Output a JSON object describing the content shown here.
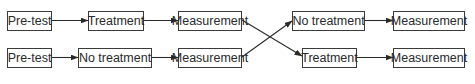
{
  "diagram": {
    "rows": [
      {
        "steps": [
          {
            "label": "Pre-test"
          },
          {
            "label": "Treatment"
          },
          {
            "label": "Measurement"
          },
          {
            "label": "No treatment"
          },
          {
            "label": "Measurement"
          }
        ]
      },
      {
        "steps": [
          {
            "label": "Pre-test"
          },
          {
            "label": "No treatment"
          },
          {
            "label": "Measurement"
          },
          {
            "label": "Treatment"
          },
          {
            "label": "Measurement"
          }
        ]
      }
    ],
    "connections": [
      {
        "from": "row1-pretest",
        "to": "row1-treatment"
      },
      {
        "from": "row1-treatment",
        "to": "row1-measurement-1"
      },
      {
        "from": "row1-measurement-1",
        "to": "row2-treatment",
        "type": "crossover"
      },
      {
        "from": "row2-measurement-1",
        "to": "row1-no-treatment",
        "type": "crossover"
      },
      {
        "from": "row1-no-treatment",
        "to": "row1-measurement-2"
      },
      {
        "from": "row2-pretest",
        "to": "row2-no-treatment"
      },
      {
        "from": "row2-no-treatment",
        "to": "row2-measurement-1"
      },
      {
        "from": "row2-treatment",
        "to": "row2-measurement-2"
      }
    ],
    "colors": {
      "line": "#2a2a2a",
      "border": "#3a3a3a",
      "text": "#2a2a2a",
      "background": "#ffffff"
    }
  }
}
